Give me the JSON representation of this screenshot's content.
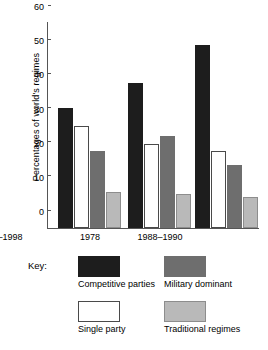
{
  "chart_data": {
    "type": "bar",
    "title": "",
    "xlabel": "",
    "ylabel": "Percentages of world's regimes",
    "categories": [
      "1978",
      "1988–1990",
      "1997–1998"
    ],
    "ylim": [
      0,
      60
    ],
    "yticks": [
      0,
      10,
      20,
      30,
      40,
      50,
      60
    ],
    "ytick_labels": [
      "0",
      "10",
      "20",
      "30",
      "40",
      "50",
      "60"
    ],
    "grid": false,
    "legend_position": "below-plot",
    "legend_title": "Key:",
    "series": [
      {
        "name": "Competitive parties",
        "color": "#1d1d1d",
        "values": [
          35,
          42.5,
          53.5
        ]
      },
      {
        "name": "Single party",
        "color": "#ffffff",
        "values": [
          30,
          24.5,
          22.5
        ]
      },
      {
        "name": "Military dominant",
        "color": "#6e6e6e",
        "values": [
          22.5,
          27,
          18.5
        ]
      },
      {
        "name": "Traditional regimes",
        "color": "#b9b9b9",
        "values": [
          10.5,
          10,
          9
        ]
      }
    ]
  },
  "key": {
    "label": "Key:",
    "entries": [
      {
        "label": "Competitive parties",
        "swatch": "black-filled-swatch"
      },
      {
        "label": "Military dominant",
        "swatch": "dark-gray-filled-swatch"
      },
      {
        "label": "Single party",
        "swatch": "white-outlined-swatch"
      },
      {
        "label": "Traditional regimes",
        "swatch": "light-gray-filled-swatch"
      }
    ]
  }
}
